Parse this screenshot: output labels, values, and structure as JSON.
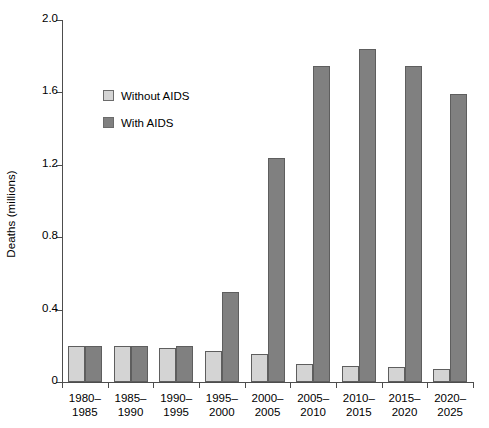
{
  "chart_data": {
    "type": "bar",
    "title": "",
    "xlabel": "",
    "ylabel": "Deaths (millions)",
    "ylim": [
      0,
      2.0
    ],
    "yticks": [
      "0",
      "0.4",
      "0.8",
      "1.2",
      "1.6",
      "2.0"
    ],
    "ytick_values": [
      0,
      0.4,
      0.8,
      1.2,
      1.6,
      2.0
    ],
    "grid": false,
    "legend_position": "upper left inside",
    "categories": [
      "1980–1985",
      "1985–1990",
      "1990–1995",
      "1995–2000",
      "2000–2005",
      "2005–2010",
      "2010–2015",
      "2015–2020",
      "2020–2025"
    ],
    "category_lines": [
      [
        "1980–",
        "1985"
      ],
      [
        "1985–",
        "1990"
      ],
      [
        "1990–",
        "1995"
      ],
      [
        "1995–",
        "2000"
      ],
      [
        "2000–",
        "2005"
      ],
      [
        "2005–",
        "2010"
      ],
      [
        "2010–",
        "2015"
      ],
      [
        "2015–",
        "2020"
      ],
      [
        "2020–",
        "2025"
      ]
    ],
    "series": [
      {
        "name": "Without AIDS",
        "color": "#d4d4d4",
        "values": [
          0.2,
          0.2,
          0.19,
          0.17,
          0.155,
          0.1,
          0.09,
          0.085,
          0.07
        ]
      },
      {
        "name": "With AIDS",
        "color": "#808080",
        "values": [
          0.2,
          0.2,
          0.2,
          0.5,
          1.24,
          1.745,
          1.84,
          1.745,
          1.59
        ]
      }
    ]
  },
  "legend": {
    "items": [
      {
        "label": "Without AIDS",
        "color": "#d4d4d4"
      },
      {
        "label": "With AIDS",
        "color": "#808080"
      }
    ]
  },
  "axes": {
    "y_title": "Deaths (millions)"
  }
}
